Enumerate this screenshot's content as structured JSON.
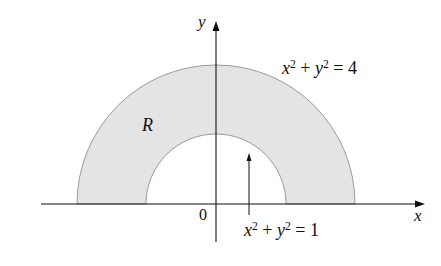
{
  "diagram": {
    "region_label": "R",
    "axes": {
      "x_label": "x",
      "y_label": "y",
      "origin_label": "0"
    },
    "outer_circle": {
      "lhs_x": "x",
      "lhs_y": "y",
      "exp": "2",
      "plus": "+",
      "eq": "=",
      "rhs": "4",
      "radius": 2
    },
    "inner_circle": {
      "lhs_x": "x",
      "lhs_y": "y",
      "exp": "2",
      "plus": "+",
      "eq": "=",
      "rhs": "1",
      "radius": 1
    },
    "colors": {
      "region_fill": "#e4e4e4",
      "region_stroke": "#9a9a9a",
      "axis": "#111111"
    }
  }
}
